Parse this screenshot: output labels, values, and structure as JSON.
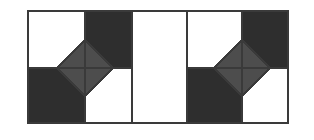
{
  "figure": {
    "canvas": {
      "width": 314,
      "height": 140
    },
    "colors": {
      "background": "#ffffff",
      "panel_fill_light": "#ffffff",
      "panel_fill_dark": "#2e2e2e",
      "diamond_fill": "#4d4d4d",
      "stroke": "#3a3a3a",
      "stroke_light": "#888888"
    },
    "stroke_widths": {
      "outline": 1.6,
      "divider": 1.6,
      "diamond_edge": 1.6,
      "diamond_cross": 1.4
    },
    "bounds": {
      "left": 28,
      "top": 11,
      "right": 288,
      "bottom": 123
    },
    "panels": [
      {
        "name": "left-panel",
        "type": "quadrant-with-diamond",
        "x": 28,
        "y": 11,
        "width": 104,
        "height": 112,
        "center_x": 85,
        "center_y": 68,
        "quadrants": [
          {
            "position": "top-left",
            "fill": "light"
          },
          {
            "position": "top-right",
            "fill": "dark"
          },
          {
            "position": "bottom-left",
            "fill": "dark"
          },
          {
            "position": "bottom-right",
            "fill": "light"
          }
        ],
        "diamond": {
          "center_x": 85,
          "center_y": 68,
          "radius_x": 28,
          "radius_y": 28,
          "fill": "diamond_fill",
          "subdivisions": 4,
          "cross_lines": [
            "vertical",
            "horizontal"
          ]
        }
      },
      {
        "name": "middle-panel",
        "type": "plain",
        "x": 132,
        "y": 11,
        "width": 55,
        "height": 112,
        "fill": "light"
      },
      {
        "name": "right-panel",
        "type": "quadrant-with-diamond",
        "x": 187,
        "y": 11,
        "width": 101,
        "height": 112,
        "center_x": 242,
        "center_y": 68,
        "quadrants": [
          {
            "position": "top-left",
            "fill": "light"
          },
          {
            "position": "top-right",
            "fill": "dark"
          },
          {
            "position": "bottom-left",
            "fill": "dark"
          },
          {
            "position": "bottom-right",
            "fill": "light"
          }
        ],
        "diamond": {
          "center_x": 242,
          "center_y": 68,
          "radius_x": 28,
          "radius_y": 28,
          "fill": "diamond_fill",
          "subdivisions": 4,
          "cross_lines": [
            "vertical",
            "horizontal"
          ]
        }
      }
    ]
  }
}
